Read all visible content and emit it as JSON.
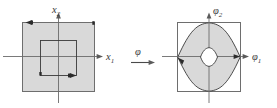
{
  "figure": {
    "colors": {
      "fill_gray": "#d9d9d9",
      "outline_gray": "#6e6e6e",
      "curve_dark": "#3a3a3a",
      "axis_gray": "#6b6b6b",
      "background": "#ffffff"
    }
  },
  "left_panel": {
    "name": "domain-panel",
    "axis_x_label": "x",
    "axis_x_sub": "1",
    "axis_y_label": "x",
    "axis_y_sub": "2",
    "outer_region_shape": "filled-square",
    "inner_region_shape": "open-square",
    "orientation_arrows": [
      "left-on-outer-top-edge",
      "right-on-inner-bottom-edge"
    ]
  },
  "map_symbol": {
    "name": "mapping-arrow",
    "label": "φ",
    "arrow": "→"
  },
  "right_panel": {
    "name": "image-panel",
    "axis_x_label": "φ",
    "axis_x_sub": "1",
    "axis_y_label": "φ",
    "axis_y_sub": "2",
    "outer_region_shape": "open-square",
    "image_region_shape": "four-arc-lens-filled",
    "inner_region_shape": "small-lens",
    "orientation_arrows": [
      "down-left-at-left-vertex",
      "right-at-right-vertex"
    ]
  }
}
